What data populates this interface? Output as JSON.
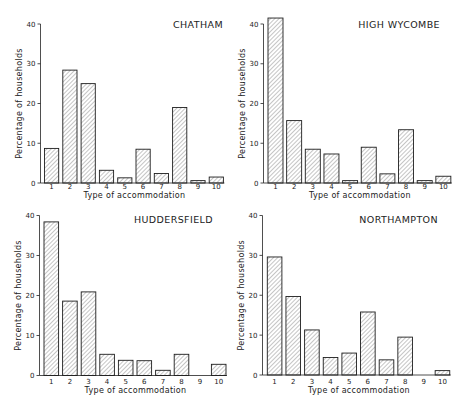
{
  "chart_data": [
    {
      "type": "bar",
      "title": "CHATHAM",
      "xlabel": "Type of accommodation",
      "ylabel": "Percentage of households",
      "categories": [
        "1",
        "2",
        "3",
        "4",
        "5",
        "6",
        "7",
        "8",
        "9",
        "10"
      ],
      "values": [
        8.7,
        28.4,
        25.0,
        3.2,
        1.3,
        8.5,
        2.4,
        19.0,
        0.6,
        1.5
      ],
      "ylim": [
        0,
        40
      ],
      "yticks": [
        0,
        10,
        20,
        30,
        40
      ],
      "grid": false,
      "legend": "none",
      "bar_fill": "diagonal-hatch"
    },
    {
      "type": "bar",
      "title": "HIGH WYCOMBE",
      "xlabel": "Type of accommodation",
      "ylabel": "Percentage of households",
      "categories": [
        "1",
        "2",
        "3",
        "4",
        "5",
        "6",
        "7",
        "8",
        "9",
        "10"
      ],
      "values": [
        41.5,
        15.7,
        8.5,
        7.3,
        0.6,
        9.0,
        2.3,
        13.4,
        0.6,
        1.7
      ],
      "ylim": [
        0,
        40
      ],
      "yticks": [
        0,
        10,
        20,
        30,
        40
      ],
      "grid": false,
      "legend": "none",
      "bar_fill": "diagonal-hatch"
    },
    {
      "type": "bar",
      "title": "HUDDERSFIELD",
      "xlabel": "Type of accommodation",
      "ylabel": "Percentage of households",
      "categories": [
        "1",
        "2",
        "3",
        "4",
        "5",
        "6",
        "7",
        "8",
        "9",
        "10"
      ],
      "values": [
        38.4,
        18.6,
        20.9,
        5.3,
        3.8,
        3.7,
        1.3,
        5.3,
        0,
        2.8
      ],
      "ylim": [
        0,
        40
      ],
      "yticks": [
        0,
        10,
        20,
        30,
        40
      ],
      "grid": false,
      "legend": "none",
      "bar_fill": "diagonal-hatch"
    },
    {
      "type": "bar",
      "title": "NORTHAMPTON",
      "xlabel": "Type of accommodation",
      "ylabel": "Percentage of households",
      "categories": [
        "1",
        "2",
        "3",
        "4",
        "5",
        "6",
        "7",
        "8",
        "9",
        "10"
      ],
      "values": [
        29.6,
        19.7,
        11.3,
        4.4,
        5.5,
        15.8,
        3.8,
        9.5,
        0,
        1.1
      ],
      "ylim": [
        0,
        40
      ],
      "yticks": [
        0,
        10,
        20,
        30,
        40
      ],
      "grid": false,
      "legend": "none",
      "bar_fill": "diagonal-hatch"
    }
  ],
  "style": {
    "ink_color": "#222222",
    "hatch_color": "#6e6e6e",
    "bar_outline": "#1e1e1e",
    "background": "#ffffff"
  }
}
